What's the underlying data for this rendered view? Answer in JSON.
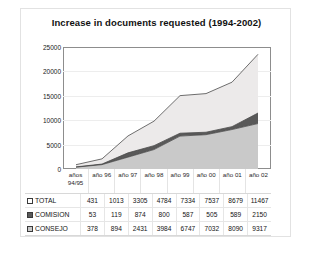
{
  "chart_data": {
    "type": "area",
    "title": "Increase in  documents requested  (1994-2002)",
    "xlabel": "",
    "ylabel": "",
    "ylim": [
      0,
      25000
    ],
    "yticks": [
      25000,
      20000,
      15000,
      10000,
      5000,
      0
    ],
    "grid": true,
    "legend_position": "bottom-table",
    "stacked": false,
    "categories": [
      "años 94/95",
      "año 96",
      "año 97",
      "año 98",
      "año 99",
      "año 00",
      "año 01",
      "año 02"
    ],
    "series": [
      {
        "name": "TOTAL",
        "color": "#eceaea",
        "values": [
          431,
          1013,
          3305,
          4784,
          7334,
          7537,
          8679,
          11467
        ]
      },
      {
        "name": "COMISION",
        "color": "#595959",
        "values": [
          53,
          119,
          874,
          800,
          587,
          505,
          589,
          2150
        ]
      },
      {
        "name": "CONSEJO",
        "color": "#c9c9c9",
        "values": [
          378,
          894,
          2431,
          3984,
          6747,
          7032,
          8090,
          9317
        ]
      }
    ]
  },
  "table": {
    "rows": [
      {
        "label": "TOTAL",
        "swatch": "#ffffff",
        "values": [
          "431",
          "1013",
          "3305",
          "4784",
          "7334",
          "7537",
          "8679",
          "11467"
        ]
      },
      {
        "label": "COMISION",
        "swatch": "#595959",
        "values": [
          "53",
          "119",
          "874",
          "800",
          "587",
          "505",
          "589",
          "2150"
        ]
      },
      {
        "label": "CONSEJO",
        "swatch": "#c9c9c9",
        "values": [
          "378",
          "894",
          "2431",
          "3984",
          "6747",
          "7032",
          "8090",
          "9317"
        ]
      }
    ]
  }
}
